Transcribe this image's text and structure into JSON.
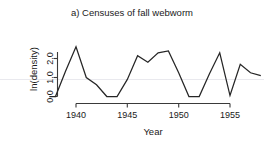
{
  "chart_data": {
    "type": "line",
    "title": "a) Censuses of fall webworm",
    "xlabel": "Year",
    "ylabel": "ln(density)",
    "xlim": [
      1937.2,
      1958.4
    ],
    "ylim": [
      -0.18,
      2.72
    ],
    "xticks": [
      1940,
      1945,
      1950,
      1955
    ],
    "xticklabels": [
      "1940",
      "1945",
      "1950",
      "1955"
    ],
    "yticks": [
      0.0,
      1.0,
      2.0
    ],
    "yticklabels": [
      "0.0",
      "1.0",
      "2.0"
    ],
    "grid": false,
    "legend": null,
    "series": [
      {
        "name": "fall webworm ln(density)",
        "x": [
          1937.4,
          1938.0,
          1939.0,
          1940.0,
          1941.0,
          1942.0,
          1943.0,
          1944.0,
          1945.0,
          1946.0,
          1947.0,
          1948.0,
          1949.0,
          1950.0,
          1951.0,
          1952.0,
          1953.0,
          1954.0,
          1955.0,
          1956.0,
          1957.0,
          1958.0
        ],
        "y": [
          0.0,
          0.0,
          1.35,
          2.62,
          1.0,
          0.62,
          0.0,
          0.0,
          0.9,
          2.15,
          1.8,
          2.3,
          2.4,
          1.25,
          0.0,
          0.0,
          1.2,
          2.3,
          0.05,
          1.7,
          1.25,
          1.1
        ]
      }
    ]
  },
  "figure": {
    "panel_label": "a)",
    "line_color": "#262626",
    "axis_color": "#3a3a3a",
    "background": "#ffffff"
  }
}
